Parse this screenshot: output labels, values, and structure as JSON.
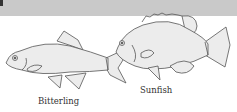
{
  "figure": {
    "header_band_color": "#c9c9c9",
    "fish_fill": "#ececec",
    "outline_color": "#555555",
    "fishes": [
      {
        "name": "Bitterling",
        "label": "Bitterling"
      },
      {
        "name": "Sunfish",
        "label": "Sunfish"
      }
    ]
  }
}
